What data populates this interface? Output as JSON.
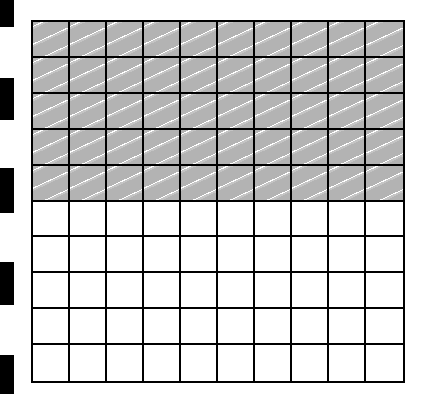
{
  "diagram": {
    "type": "hundred-grid",
    "rows": 10,
    "columns": 10,
    "shaded_rows": 5,
    "shaded_cells": 50,
    "total_cells": 100,
    "shade_color": "#b3b3b3",
    "line_color": "#000000"
  },
  "binder_marks": [
    {
      "top": 0,
      "height": 27
    },
    {
      "top": 78,
      "height": 42
    },
    {
      "top": 168,
      "height": 45
    },
    {
      "top": 262,
      "height": 43
    },
    {
      "top": 355,
      "height": 39
    }
  ]
}
